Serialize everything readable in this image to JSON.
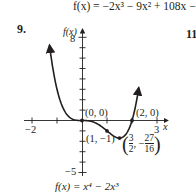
{
  "header": {
    "top_formula": "f(x) = −2x³ − 9x² + 108x −10"
  },
  "exercise_number": "9.",
  "next_exercise_number": "11",
  "graph": {
    "y_axis_label": "f(x)",
    "x_axis_label": "x",
    "y_tick_top_label": "8",
    "y_tick_bottom_label": "−5",
    "x_tick_left_label": "−2",
    "x_tick_right_label": "3",
    "points": {
      "origin": "(0, 0)",
      "root2": "(2, 0)",
      "inflection": "(1, −1)",
      "min_open": "(",
      "min_x_num": "3",
      "min_x_den": "2",
      "min_sep": ", −",
      "min_y_num": "27",
      "min_y_den": "16",
      "min_close": ")"
    },
    "caption": "f(x) = x⁴ − 2x³"
  },
  "chart_data": {
    "type": "line",
    "xlabel": "x",
    "ylabel": "f(x)",
    "xlim": [
      -2,
      3
    ],
    "ylim": [
      -5,
      8
    ],
    "grid": false,
    "labeled_ticks": {
      "x": [
        -2,
        3
      ],
      "y": [
        8,
        -5
      ]
    },
    "annotated_points": [
      {
        "x": 0,
        "y": 0,
        "label": "(0, 0)"
      },
      {
        "x": 2,
        "y": 0,
        "label": "(2, 0)"
      },
      {
        "x": 1,
        "y": -1,
        "label": "(1, -1)"
      },
      {
        "x": 1.5,
        "y": -1.6875,
        "label": "(3/2, -27/16)"
      }
    ],
    "series": [
      {
        "name": "f(x) = x^4 - 2x^3",
        "x": [
          -1.3,
          -1.0,
          -0.5,
          0,
          0.5,
          1.0,
          1.5,
          2.0,
          2.27
        ],
        "values": [
          7.25,
          3.0,
          0.31,
          0,
          -0.19,
          -1.0,
          -1.69,
          0,
          3.4
        ]
      }
    ]
  }
}
